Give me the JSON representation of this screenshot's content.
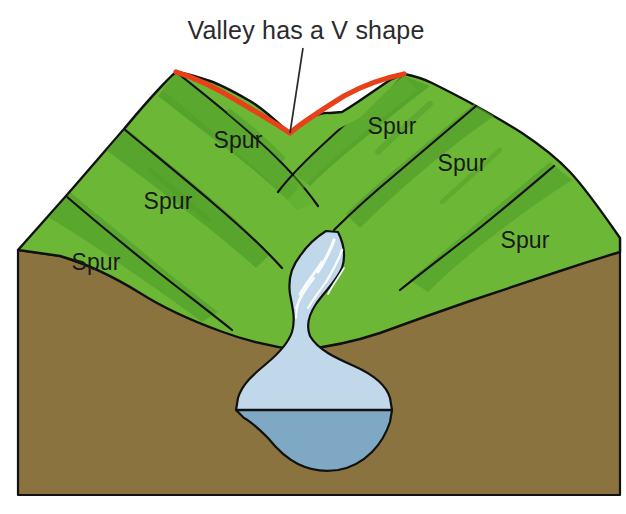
{
  "figure": {
    "title": "Valley has a V shape"
  },
  "labels": {
    "spur_left_upper": "Spur",
    "spur_left_middle": "Spur",
    "spur_left_lower": "Spur",
    "spur_right_upper": "Spur",
    "spur_right_middle": "Spur",
    "spur_right_lower": "Spur"
  },
  "colors": {
    "grass_light": "#6cb836",
    "grass_mid": "#5fad30",
    "grass_shade": "#4f9c29",
    "soil": "#8b7340",
    "soil_edge": "#6d5a30",
    "water_surface": "#c1d7ea",
    "water_section": "#7fa8c4",
    "water_highlight": "#ffffff",
    "ridge_line": "#e8411a",
    "outline": "#111111",
    "text": "#1a1a1a",
    "background": "#ffffff"
  },
  "annotation": {
    "leader_line_from_x": 303,
    "leader_line_from_y": 48,
    "leader_line_to_x": 290,
    "leader_line_to_y": 133
  }
}
